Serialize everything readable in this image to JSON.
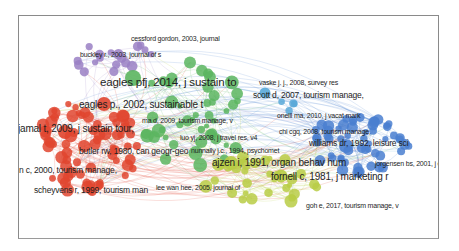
{
  "colors": {
    "red": "#e0452f",
    "green": "#5bb55f",
    "purple": "#9a80c4",
    "blue": "#4a7fd0",
    "yellow_green": "#b8cc45",
    "light_blue": "#58a8d8",
    "frame_border": "#8a8a8a"
  },
  "clusters": [
    {
      "name": "red",
      "color": "#e0452f"
    },
    {
      "name": "green",
      "color": "#5bb55f"
    },
    {
      "name": "purple",
      "color": "#9a80c4"
    },
    {
      "name": "blue",
      "color": "#4a7fd0"
    },
    {
      "name": "yellow-green",
      "color": "#b8cc45"
    }
  ],
  "labels": [
    {
      "text": "cessford gordon, 2003, journal",
      "cluster": "purple",
      "size": "s1"
    },
    {
      "text": "buckley r., 2003, journal of s",
      "cluster": "purple",
      "size": "s1"
    },
    {
      "text": "eagles pfj, 2014, j sustain to",
      "cluster": "purple",
      "size": "s4"
    },
    {
      "text": "eagles p., 2002, sustainable t",
      "cluster": "red",
      "size": "s3"
    },
    {
      "text": "vaske j. j., 2008, survey res",
      "cluster": "green",
      "size": "s1"
    },
    {
      "text": "scott d, 2007, tourism manage,",
      "cluster": "light_blue",
      "size": "s2"
    },
    {
      "text": "oneill ma, 2010, j vacat mark",
      "cluster": "blue",
      "size": "s1"
    },
    {
      "text": "ma d, 2009, tourism manage, v",
      "cluster": "green",
      "size": "s1"
    },
    {
      "text": "chi cgq, 2008, tourism manage,",
      "cluster": "blue",
      "size": "s1"
    },
    {
      "text": "jamal t, 2009, j sustain tour,",
      "cluster": "red",
      "size": "s3"
    },
    {
      "text": "luo yj, 2008, j travel res, v4",
      "cluster": "green",
      "size": "s1"
    },
    {
      "text": "williams dr, 1992, leisure sci",
      "cluster": "blue",
      "size": "s2"
    },
    {
      "text": "nunnally j.c., 1994, psychomet",
      "cluster": "yellow_green",
      "size": "s1"
    },
    {
      "text": "butler rw, 1980, can geogr-geo",
      "cluster": "red",
      "size": "s2"
    },
    {
      "text": "ajzen i, 1991, organ behav hum",
      "cluster": "yellow_green",
      "size": "s3"
    },
    {
      "text": "jorgensen bs, 2001, j env",
      "cluster": "blue",
      "size": "s1"
    },
    {
      "text": "n c, 2000, tourism manage,",
      "cluster": "red",
      "size": "s2"
    },
    {
      "text": "fornell c, 1981, j marketing r",
      "cluster": "yellow_green",
      "size": "s3"
    },
    {
      "text": "scheyvens r, 1999, tourism man",
      "cluster": "red",
      "size": "s2"
    },
    {
      "text": "lee wan hee, 2005, journal of",
      "cluster": "green",
      "size": "s1"
    },
    {
      "text": "goh e, 2017, tourism manage, v",
      "cluster": "yellow_green",
      "size": "s1"
    }
  ]
}
